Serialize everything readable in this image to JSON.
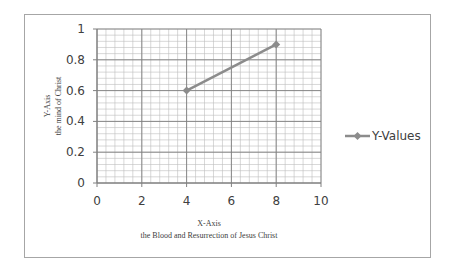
{
  "chart_data": {
    "type": "line",
    "title": "",
    "xlabel": "X-Axis",
    "xlabel_sub": "the Blood and Resurrection of Jesus Christ",
    "ylabel": "Y-Axis",
    "ylabel_sub": "the mind of Christ",
    "xlim": [
      0,
      10
    ],
    "ylim": [
      0,
      1
    ],
    "x_ticks": [
      0,
      2,
      4,
      6,
      8,
      10
    ],
    "x_tick_labels": [
      "0",
      "2",
      "4",
      "6",
      "8",
      "10"
    ],
    "y_ticks": [
      0,
      0.2,
      0.4,
      0.6,
      0.8,
      1
    ],
    "y_tick_labels": [
      "0",
      "0.2",
      "0.4",
      "0.6",
      "0.8",
      "1"
    ],
    "x_minor_step": 0.4,
    "y_minor_step": 0.04,
    "grid": true,
    "legend_position": "right",
    "series": [
      {
        "name": "Y-Values",
        "color": "#8c8c8c",
        "marker": "diamond",
        "x": [
          4,
          8
        ],
        "y": [
          0.6,
          0.9
        ]
      }
    ]
  }
}
